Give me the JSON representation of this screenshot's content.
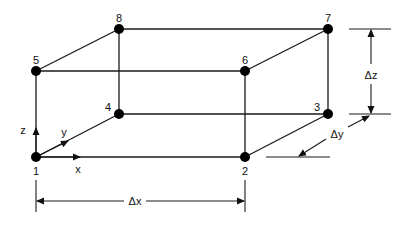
{
  "diagram": {
    "nodes": [
      {
        "id": "1",
        "x": 36,
        "y": 157,
        "lx": 36,
        "ly": 175
      },
      {
        "id": "2",
        "x": 245,
        "y": 157,
        "lx": 245,
        "ly": 175
      },
      {
        "id": "3",
        "x": 328,
        "y": 114,
        "lx": 317,
        "ly": 111
      },
      {
        "id": "4",
        "x": 119,
        "y": 114,
        "lx": 108,
        "ly": 111
      },
      {
        "id": "5",
        "x": 36,
        "y": 71,
        "lx": 36,
        "ly": 64
      },
      {
        "id": "6",
        "x": 245,
        "y": 71,
        "lx": 245,
        "ly": 64
      },
      {
        "id": "7",
        "x": 328,
        "y": 29,
        "lx": 328,
        "ly": 22
      },
      {
        "id": "8",
        "x": 119,
        "y": 29,
        "lx": 119,
        "ly": 22
      }
    ],
    "axes": {
      "x_label": "x",
      "y_label": "y",
      "z_label": "z"
    },
    "dimensions": {
      "dx_label": "Δx",
      "dy_label": "Δy",
      "dz_label": "Δz"
    },
    "colors": {
      "line": "#1a1a1a",
      "node": "#000000",
      "background": "#ffffff"
    }
  }
}
